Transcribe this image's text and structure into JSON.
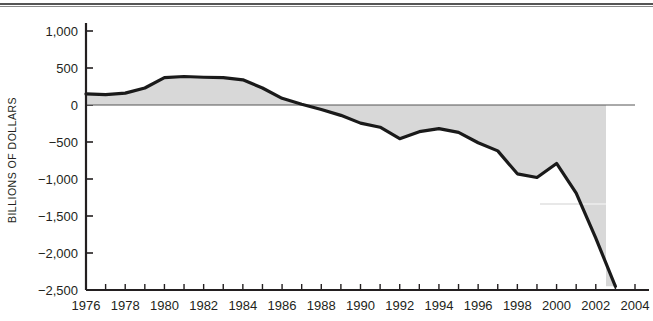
{
  "chart_data": {
    "type": "area",
    "title": "",
    "subtitle": "",
    "xlabel": "",
    "ylabel": "BILLIONS OF DOLLARS",
    "xlim": [
      1976,
      2004
    ],
    "ylim": [
      -2500,
      1000
    ],
    "grid": false,
    "legend": false,
    "zero_line": 0,
    "fill_color": "#d8d8d8",
    "line_color": "#1a1a1a",
    "axis_color": "#231f20",
    "x_tick_step": 1,
    "x_label_step": 2,
    "y_tick_step": 500,
    "x_tick_labels": [
      "1976",
      "1978",
      "1980",
      "1982",
      "1984",
      "1986",
      "1988",
      "1990",
      "1992",
      "1994",
      "1996",
      "1998",
      "2000",
      "2002",
      "2004"
    ],
    "y_tick_labels": [
      "1,000",
      "500",
      "0",
      "−500",
      "−1,000",
      "−1,500",
      "−2,000",
      "−2,500"
    ],
    "y_tick_values": [
      1000,
      500,
      0,
      -500,
      -1000,
      -1500,
      -2000,
      -2500
    ],
    "x": [
      1976,
      1977,
      1978,
      1979,
      1980,
      1981,
      1982,
      1983,
      1984,
      1985,
      1986,
      1987,
      1988,
      1989,
      1990,
      1991,
      1992,
      1993,
      1994,
      1995,
      1996,
      1997,
      1998,
      1999,
      2000,
      2001,
      2002,
      2003
    ],
    "values": [
      150,
      140,
      160,
      230,
      370,
      385,
      375,
      370,
      340,
      230,
      90,
      10,
      -60,
      -140,
      -245,
      -300,
      -455,
      -360,
      -320,
      -370,
      -510,
      -620,
      -930,
      -980,
      -790,
      -1190,
      -1800,
      -2450
    ],
    "series": [
      {
        "name": "Balance",
        "values": [
          150,
          140,
          160,
          230,
          370,
          385,
          375,
          370,
          340,
          230,
          90,
          10,
          -60,
          -140,
          -245,
          -300,
          -455,
          -360,
          -320,
          -370,
          -510,
          -620,
          -930,
          -980,
          -790,
          -1190,
          -1800,
          -2450
        ]
      }
    ]
  }
}
